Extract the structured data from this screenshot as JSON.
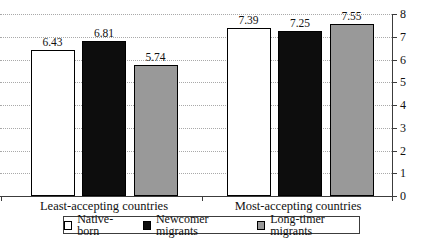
{
  "chart_data": {
    "type": "bar",
    "title": "",
    "categories": [
      "Least-accepting countries",
      "Most-accepting countries"
    ],
    "series": [
      {
        "name": "Native-born",
        "color": "#ffffff",
        "values": [
          6.43,
          7.39
        ]
      },
      {
        "name": "Newcomer migrants",
        "color": "#0d0d0d",
        "values": [
          6.81,
          7.25
        ]
      },
      {
        "name": "Long-timer migrants",
        "color": "#999999",
        "values": [
          5.74,
          7.55
        ]
      }
    ],
    "value_labels": [
      [
        "6.43",
        "7.39"
      ],
      [
        "6.81",
        "7.25"
      ],
      [
        "5.74",
        "7.55"
      ]
    ],
    "ylim": [
      0,
      8
    ],
    "yticks": [
      0,
      1,
      2,
      3,
      4,
      5,
      6,
      7,
      8
    ],
    "axis_side": "right",
    "grid": "horizontal-dotted",
    "legend_position": "bottom"
  },
  "colors": {
    "background": "#ffffff",
    "bar_border": "#000000",
    "grid": "#a9a9a9",
    "axis": "#3c3c3c",
    "legend_border": "#3c3c3c"
  }
}
